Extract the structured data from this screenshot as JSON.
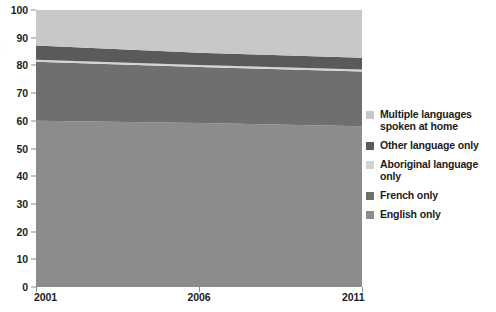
{
  "chart_data": {
    "type": "area",
    "stacked": true,
    "title": "",
    "xlabel": "",
    "ylabel": "",
    "x": [
      2001,
      2006,
      2011
    ],
    "xlim": [
      2001,
      2011
    ],
    "ylim": [
      0,
      100
    ],
    "yticks": [
      0,
      10,
      20,
      30,
      40,
      50,
      60,
      70,
      80,
      90,
      100
    ],
    "xticks": [
      2001,
      2006,
      2011
    ],
    "xtick_labels": [
      "2001",
      "2006",
      "2011"
    ],
    "grid": false,
    "legend_position": "right",
    "series": [
      {
        "name": "English only",
        "color": "#8c8c8c",
        "values": [
          60.0,
          59.2,
          58.0
        ],
        "cumulative_top": [
          60.0,
          59.2,
          58.0
        ]
      },
      {
        "name": "French only",
        "color": "#6f6f6f",
        "values": [
          21.3,
          20.2,
          19.8
        ],
        "cumulative_top": [
          81.3,
          79.4,
          77.8
        ]
      },
      {
        "name": "Aboriginal language only",
        "color": "#d4d4d4",
        "values": [
          0.7,
          0.7,
          0.7
        ],
        "cumulative_top": [
          82.0,
          80.1,
          78.5
        ]
      },
      {
        "name": "Other language only",
        "color": "#5a5a5a",
        "values": [
          5.2,
          4.5,
          4.3
        ],
        "cumulative_top": [
          87.2,
          84.6,
          82.8
        ]
      },
      {
        "name": "Multiple languages spoken at home",
        "color": "#c8c8c8",
        "values": [
          12.8,
          15.4,
          17.2
        ],
        "cumulative_top": [
          100.0,
          100.0,
          100.0
        ]
      }
    ]
  },
  "axis": {
    "y_labels": [
      "100",
      "90",
      "80",
      "70",
      "60",
      "50",
      "40",
      "30",
      "20",
      "10",
      "0"
    ],
    "x_labels": [
      "2001",
      "2006",
      "2011"
    ],
    "edge_glyph": ")"
  },
  "legend": {
    "items": [
      {
        "label": "Multiple languages\nspoken at home",
        "color": "#c8c8c8"
      },
      {
        "label": "Other language only",
        "color": "#5a5a5a"
      },
      {
        "label": "Aboriginal language only",
        "color": "#d4d4d4"
      },
      {
        "label": "French only",
        "color": "#6f6f6f"
      },
      {
        "label": "English only",
        "color": "#8c8c8c"
      }
    ]
  }
}
